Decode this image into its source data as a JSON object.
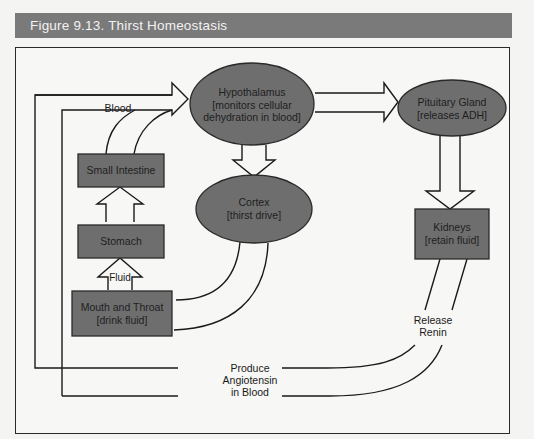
{
  "figure": {
    "title": "Figure 9.13. Thirst Homeostasis"
  },
  "colors": {
    "title_bar": "#7a7a7a",
    "node_fill": "#6e6e6e",
    "line": "#1a1a1a",
    "background": "#f7f7f5"
  },
  "nodes": {
    "hypothalamus": {
      "shape": "ellipse",
      "line1": "Hypothalamus",
      "line2": "[monitors cellular",
      "line3": "dehydration in blood]"
    },
    "pituitary": {
      "shape": "ellipse",
      "line1": "Pituitary Gland",
      "line2": "[releases ADH]"
    },
    "cortex": {
      "shape": "ellipse",
      "line1": "Cortex",
      "line2": "[thirst drive]"
    },
    "kidneys": {
      "shape": "rect",
      "line1": "Kidneys",
      "line2": "[retain fluid]"
    },
    "small_intestine": {
      "shape": "rect",
      "line1": "Small Intestine"
    },
    "stomach": {
      "shape": "rect",
      "line1": "Stomach"
    },
    "mouth_throat": {
      "shape": "rect",
      "line1": "Mouth and Throat",
      "line2": "[drink fluid]"
    }
  },
  "edge_labels": {
    "blood": "Blood",
    "fluid": "Fluid",
    "release_renin_1": "Release",
    "release_renin_2": "Renin",
    "angiotensin_1": "Produce",
    "angiotensin_2": "Angiotensin",
    "angiotensin_3": "in Blood"
  },
  "edges": [
    {
      "from": "mouth_throat",
      "to": "stomach",
      "label": "Fluid"
    },
    {
      "from": "stomach",
      "to": "small_intestine"
    },
    {
      "from": "small_intestine",
      "to": "hypothalamus",
      "label": "Blood"
    },
    {
      "from": "hypothalamus",
      "to": "cortex"
    },
    {
      "from": "hypothalamus",
      "to": "pituitary"
    },
    {
      "from": "pituitary",
      "to": "kidneys"
    },
    {
      "from": "cortex",
      "to": "mouth_throat"
    },
    {
      "from": "kidneys",
      "to": "hypothalamus",
      "label": "Release Renin / Produce Angiotensin in Blood"
    }
  ]
}
